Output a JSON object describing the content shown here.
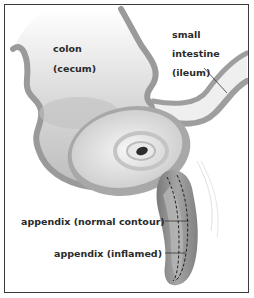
{
  "diagram": {
    "labels": {
      "colon_line1": "colon",
      "colon_line2": "(cecum)",
      "small_intestine_line1": "small",
      "small_intestine_line2": "intestine",
      "small_intestine_line3": "(ileum)",
      "appendix_normal": "appendix (normal contour)",
      "appendix_inflamed": "appendix (inflamed)"
    },
    "colors": {
      "frame": "#3a3a3a",
      "tissue_wall": "#9a9a9a",
      "tissue_fill": "#e6e6e6",
      "inflamed": "#8c8c8c",
      "leader_lines": "#333333",
      "text": "#2a2a2a"
    }
  }
}
